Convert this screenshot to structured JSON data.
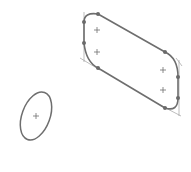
{
  "sketch": {
    "colors": {
      "background": "#ffffff",
      "profile": "#6e6e6e",
      "construction": "#9a9a9a",
      "node": "#6a6a6a",
      "marker": "#707070"
    },
    "slot": {
      "label": "rounded-parallelogram-slot",
      "nodes": [
        {
          "x": 84,
          "y": 22
        },
        {
          "x": 98,
          "y": 14
        },
        {
          "x": 84,
          "y": 43
        },
        {
          "x": 98,
          "y": 68
        },
        {
          "x": 165,
          "y": 52
        },
        {
          "x": 178,
          "y": 77
        },
        {
          "x": 178,
          "y": 98
        },
        {
          "x": 165,
          "y": 108
        }
      ],
      "center_markers": [
        {
          "x": 97,
          "y": 30
        },
        {
          "x": 97,
          "y": 52
        },
        {
          "x": 163,
          "y": 70
        },
        {
          "x": 163,
          "y": 90
        }
      ]
    },
    "ellipse": {
      "label": "ellipse",
      "cx": 36,
      "cy": 116,
      "rx": 14,
      "ry": 25,
      "rotation_deg": 20
    }
  }
}
